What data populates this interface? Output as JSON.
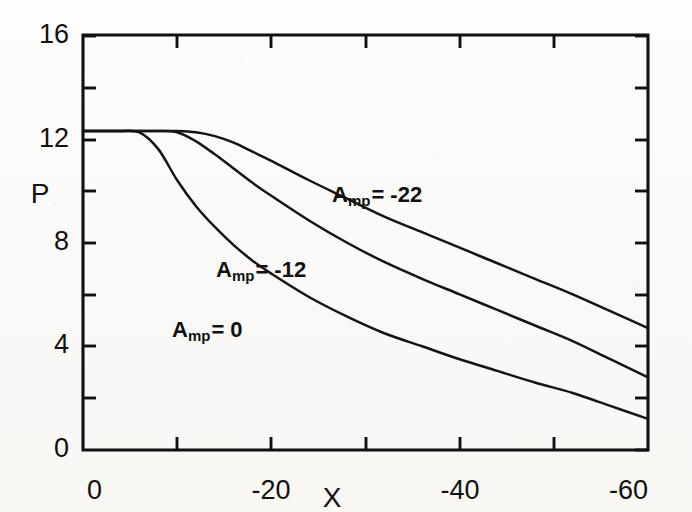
{
  "chart_data": {
    "type": "line",
    "title": "",
    "subtitle": "",
    "xlabel": "X",
    "ylabel": "P",
    "xlim": [
      0,
      -60
    ],
    "ylim": [
      0,
      16
    ],
    "grid": false,
    "legend_position": "inline-annotations",
    "x_ticks_major": [
      0,
      -10,
      -20,
      -30,
      -40,
      -50,
      -60
    ],
    "x_tick_labels": [
      "0",
      "",
      "-20",
      "",
      "-40",
      "",
      "-60"
    ],
    "y_ticks_major": [
      0,
      4,
      8,
      12,
      16
    ],
    "y_tick_labels": [
      "0",
      "4",
      "8",
      "12",
      "16"
    ],
    "y_ticks_minor": [
      2,
      6,
      10,
      14
    ],
    "x": [
      0,
      -2,
      -4,
      -6,
      -8,
      -10,
      -12,
      -14,
      -16,
      -18,
      -20,
      -24,
      -28,
      -32,
      -36,
      -40,
      -44,
      -48,
      -52,
      -56,
      -60
    ],
    "series": [
      {
        "name": "A_mp = 0",
        "label_text": "A",
        "label_sub": "mp",
        "label_tail": "= 0",
        "values": [
          12.3,
          12.3,
          12.3,
          12.25,
          11.6,
          10.4,
          9.4,
          8.6,
          7.9,
          7.3,
          6.8,
          5.9,
          5.15,
          4.5,
          4.0,
          3.5,
          3.05,
          2.6,
          2.2,
          1.7,
          1.2
        ],
        "endpoint": 1.2,
        "plateau": 12.3,
        "break_x": -6
      },
      {
        "name": "A_mp = -12",
        "label_text": "A",
        "label_sub": "mp",
        "label_tail": "= -12",
        "values": [
          12.3,
          12.3,
          12.3,
          12.3,
          12.3,
          12.25,
          11.9,
          11.4,
          10.85,
          10.3,
          9.8,
          8.85,
          8.0,
          7.25,
          6.6,
          6.0,
          5.4,
          4.8,
          4.2,
          3.5,
          2.8
        ],
        "endpoint": 2.8,
        "plateau": 12.3,
        "break_x": -10
      },
      {
        "name": "A_mp = -22",
        "label_text": "A",
        "label_sub": "mp",
        "label_tail": "= -22",
        "values": [
          12.3,
          12.3,
          12.3,
          12.3,
          12.3,
          12.3,
          12.25,
          12.1,
          11.85,
          11.5,
          11.15,
          10.4,
          9.7,
          9.0,
          8.4,
          7.8,
          7.2,
          6.6,
          6.0,
          5.35,
          4.7
        ],
        "endpoint": 4.7,
        "plateau": 12.3,
        "break_x": -12
      }
    ],
    "annotations": [
      {
        "text": "A",
        "sub": "mp",
        "tail": "= -22",
        "px": 332,
        "py": 196
      },
      {
        "text": "A",
        "sub": "mp",
        "tail": "= -12",
        "px": 216,
        "py": 271
      },
      {
        "text": "A",
        "sub": "mp",
        "tail": "= 0",
        "px": 172,
        "py": 331
      }
    ]
  },
  "axes": {
    "y_title": "P",
    "x_title": "X",
    "y_title_px": {
      "x": 40,
      "y": 196
    },
    "x_title_px": {
      "x": 332,
      "y": 500
    }
  },
  "ticks": {
    "y": [
      {
        "label": "16",
        "value": 16,
        "px_y": 36,
        "major": true
      },
      {
        "label": "",
        "value": 14,
        "px_y": 88,
        "major": false
      },
      {
        "label": "12",
        "value": 12,
        "px_y": 140,
        "major": true
      },
      {
        "label": "",
        "value": 10,
        "px_y": 191,
        "major": false
      },
      {
        "label": "8",
        "value": 8,
        "px_y": 243,
        "major": true
      },
      {
        "label": "",
        "value": 6,
        "px_y": 295,
        "major": false
      },
      {
        "label": "4",
        "value": 4,
        "px_y": 346,
        "major": true
      },
      {
        "label": "",
        "value": 2,
        "px_y": 398,
        "major": false
      },
      {
        "label": "0",
        "value": 0,
        "px_y": 450,
        "major": true
      }
    ],
    "x": [
      {
        "label": "0",
        "value": 0,
        "px_x": 83,
        "major": true
      },
      {
        "label": "",
        "value": -10,
        "px_x": 177,
        "major": false
      },
      {
        "label": "-20",
        "value": -20,
        "px_x": 271,
        "major": true
      },
      {
        "label": "",
        "value": -30,
        "px_x": 366,
        "major": false
      },
      {
        "label": "-40",
        "value": -40,
        "px_x": 460,
        "major": true
      },
      {
        "label": "",
        "value": -50,
        "px_x": 554,
        "major": false
      },
      {
        "label": "-60",
        "value": -60,
        "px_x": 648,
        "major": true
      }
    ]
  },
  "colors": {
    "ink": "#111111",
    "curve": "#141414",
    "paper": "#fdfdfc"
  },
  "frame": {
    "left": 83,
    "right": 648,
    "top": 35,
    "bottom": 450
  }
}
